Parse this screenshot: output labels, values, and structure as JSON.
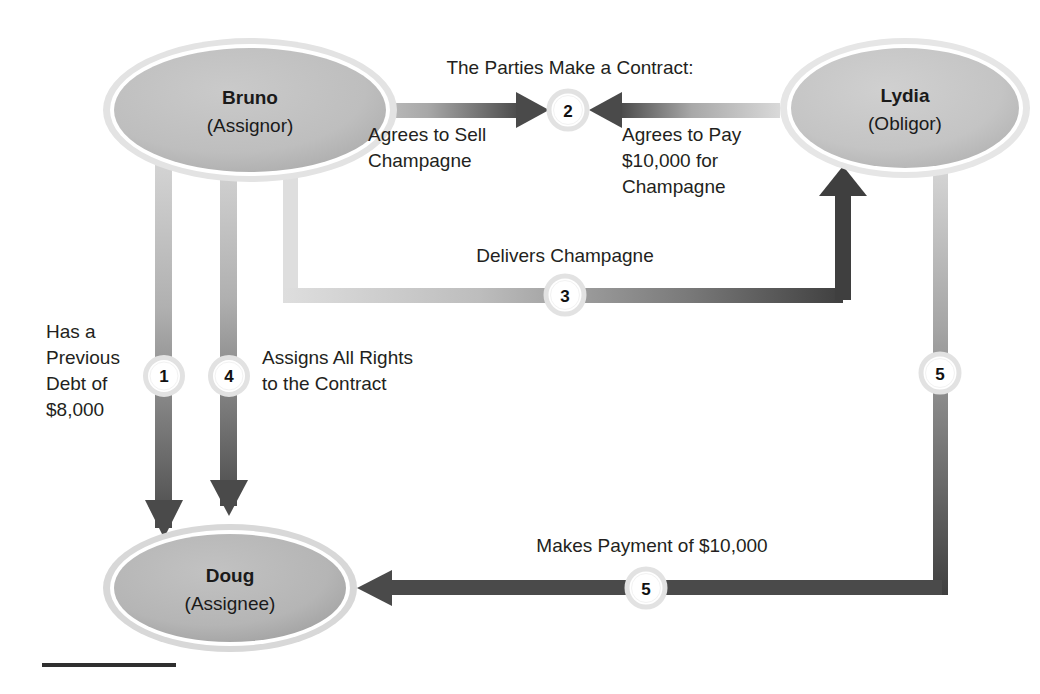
{
  "diagram": {
    "background_color": "#ffffff",
    "nodes": [
      {
        "id": "bruno",
        "name": "Bruno",
        "role": "(Assignor)",
        "fill": "#bfbfbf",
        "ring": "#e3e3e3"
      },
      {
        "id": "lydia",
        "name": "Lydia",
        "role": "(Obligor)",
        "fill": "#c6c6c6",
        "ring": "#e6e6e6"
      },
      {
        "id": "doug",
        "name": "Doug",
        "role": "(Assignee)",
        "fill": "#b4b4b4",
        "ring": "#d8d8d8"
      }
    ],
    "headings": {
      "contract": "The Parties Make a Contract:"
    },
    "edges": [
      {
        "id": "edge-1",
        "badge": "1",
        "label_lines": [
          "Has a",
          "Previous",
          "Debt of",
          "$8,000"
        ],
        "from": "bruno",
        "to": "doug",
        "direction": "down"
      },
      {
        "id": "edge-2-sell",
        "badge": "2",
        "label_lines": [
          "Agrees to Sell",
          "Champagne"
        ],
        "from": "bruno",
        "to": "contract-point",
        "direction": "right"
      },
      {
        "id": "edge-2-pay",
        "badge": "2",
        "label_lines": [
          "Agrees to Pay",
          "$10,000 for",
          "Champagne"
        ],
        "from": "lydia",
        "to": "contract-point",
        "direction": "left"
      },
      {
        "id": "edge-3",
        "badge": "3",
        "label_lines": [
          "Delivers Champagne"
        ],
        "from": "bruno",
        "to": "lydia",
        "direction": "right-up"
      },
      {
        "id": "edge-4",
        "badge": "4",
        "label_lines": [
          "Assigns All Rights",
          "to the Contract"
        ],
        "from": "bruno",
        "to": "doug",
        "direction": "down"
      },
      {
        "id": "edge-5",
        "badge": "5",
        "label_lines": [
          "Makes Payment of $10,000"
        ],
        "from": "lydia",
        "to": "doug",
        "direction": "down-left"
      }
    ],
    "badges": {
      "b1": "1",
      "b2": "2",
      "b3": "3",
      "b4": "4",
      "b5_right": "5",
      "b5_bottom": "5"
    },
    "labels": {
      "contract_heading": "The Parties Make a Contract:",
      "sell_line1": "Agrees to Sell",
      "sell_line2": "Champagne",
      "pay_line1": "Agrees to Pay",
      "pay_line2": "$10,000 for",
      "pay_line3": "Champagne",
      "delivers": "Delivers Champagne",
      "debt_line1": "Has a",
      "debt_line2": "Previous",
      "debt_line3": "Debt of",
      "debt_line4": "$8,000",
      "assign_line1": "Assigns All Rights",
      "assign_line2": "to the Contract",
      "payment": "Makes Payment of $10,000"
    },
    "colors": {
      "arrow_dark": "#4a4a4a",
      "arrow_light": "#d5d5d5",
      "text": "#231f20",
      "badge_fill": "#ffffff",
      "badge_ring": "#e0e0e0",
      "rule": "#2f2f2f"
    }
  }
}
